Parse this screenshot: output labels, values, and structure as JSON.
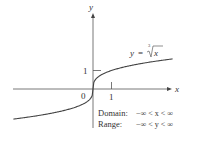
{
  "figure": {
    "function_label": {
      "lhs": "y",
      "equals": "=",
      "index": "3",
      "radicand": "x"
    },
    "axes": {
      "x_label": "x",
      "y_label": "y",
      "origin_label": "0",
      "x_tick_label": "1",
      "y_tick_label": "1"
    },
    "domain": {
      "label": "Domain:",
      "expr": "−∞ < x < ∞"
    },
    "range": {
      "label": "Range:",
      "expr": "−∞ < y < ∞"
    },
    "colors": {
      "axis": "#555555",
      "curve": "#444444",
      "text": "#333333"
    }
  },
  "chart_data": {
    "type": "line",
    "xlabel": "x",
    "ylabel": "y",
    "xlim": [
      -4.3,
      4.3
    ],
    "ylim": [
      -2.1,
      4.0
    ],
    "x_ticks": [
      1
    ],
    "y_ticks": [
      1
    ],
    "grid": false,
    "series": [
      {
        "name": "y = ∛x",
        "x": [
          -4.3,
          -3,
          -2,
          -1,
          -0.5,
          -0.1,
          0,
          0.1,
          0.5,
          1,
          2,
          3,
          4.3
        ],
        "values": [
          -1.63,
          -1.44,
          -1.26,
          -1.0,
          -0.79,
          -0.46,
          0,
          0.46,
          0.79,
          1.0,
          1.26,
          1.44,
          1.63
        ]
      }
    ],
    "annotations": [
      "Domain: −∞ < x < ∞",
      "Range: −∞ < y < ∞"
    ]
  }
}
